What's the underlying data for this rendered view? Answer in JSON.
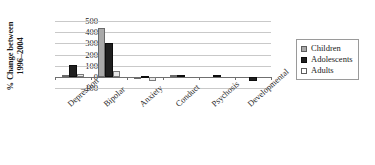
{
  "chart_data": {
    "type": "bar",
    "title": "",
    "subtitle": "",
    "xlabel": "",
    "ylabel": "% Change between 1996–2004",
    "ylabel_line1": "% Change between",
    "ylabel_line2": "1996–2004",
    "ylim": [
      -100,
      500
    ],
    "yticks": [
      500,
      400,
      300,
      200,
      100,
      0,
      -100
    ],
    "ytick_labels": [
      "500",
      "400",
      "300",
      "200",
      "100",
      "0",
      "–100"
    ],
    "grid": true,
    "legend_position": "right",
    "categories": [
      "Depression",
      "Bipolar",
      "Anxiety",
      "Conduct",
      "Psychosis",
      "Developmental"
    ],
    "series": [
      {
        "name": "Children",
        "color": "#a9a9a9",
        "values": [
          15,
          435,
          -20,
          5,
          0,
          0
        ]
      },
      {
        "name": "Adolescents",
        "color": "#1f1f1f",
        "values": [
          105,
          300,
          -10,
          15,
          10,
          -35
        ]
      },
      {
        "name": "Adults",
        "color": "#e9e9e9",
        "values": [
          25,
          55,
          -35,
          0,
          0,
          0
        ]
      }
    ]
  },
  "legend": {
    "items": [
      {
        "label": "Children"
      },
      {
        "label": "Adolescents"
      },
      {
        "label": "Adults"
      }
    ]
  }
}
